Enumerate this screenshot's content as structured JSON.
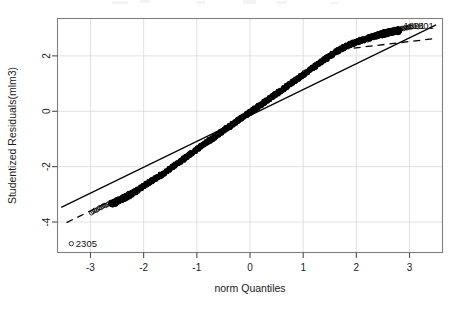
{
  "chart_data": {
    "type": "scatter",
    "title": "",
    "xlabel": "norm Quantiles",
    "ylabel": "Studentized Residuals(mlm3)",
    "xlim": [
      -3.62,
      3.62
    ],
    "ylim": [
      -5.1,
      3.35
    ],
    "xticks": [
      -3,
      -2,
      -1,
      0,
      1,
      2,
      3
    ],
    "xtick_labels": [
      "-3",
      "-2",
      "-1",
      "0",
      "1",
      "2",
      "3"
    ],
    "yticks": [
      -4,
      -2,
      0,
      2
    ],
    "ytick_labels": [
      "-4",
      "-2",
      "0",
      "2"
    ],
    "grid": true,
    "legend": "none",
    "annotations": [
      {
        "label": "2305",
        "x": -3.36,
        "y": -4.78,
        "marker": "open-circle",
        "position": "bottom-left"
      },
      {
        "label": "1801",
        "x": 3.02,
        "y": 3.05,
        "marker": "none",
        "position": "top-right"
      },
      {
        "label": "1891",
        "x": 3.16,
        "y": 3.05,
        "marker": "open-circle",
        "position": "top-right"
      }
    ],
    "series": [
      {
        "name": "studentized residuals",
        "marker": "open-circle",
        "color": "#000000",
        "n_points": 2400,
        "description": "dense quantile cloud rising monotonically from lower-left to upper-right, S-shaped deviation below the reference line in the left tail and above it in the right tail",
        "tail_points": [
          {
            "x": -3.36,
            "y": -4.78
          },
          {
            "x": -2.95,
            "y": -3.62
          },
          {
            "x": -2.86,
            "y": -3.53
          },
          {
            "x": -2.78,
            "y": -3.44
          },
          {
            "x": -2.7,
            "y": -3.38
          },
          {
            "x": -2.62,
            "y": -3.32
          },
          {
            "x": -2.54,
            "y": -3.26
          },
          {
            "x": -2.46,
            "y": -3.18
          },
          {
            "x": -2.38,
            "y": -3.1
          },
          {
            "x": -2.3,
            "y": -3.02
          },
          {
            "x": -2.2,
            "y": -2.92
          },
          {
            "x": -2.1,
            "y": -2.8
          },
          {
            "x": -2.0,
            "y": -2.66
          },
          {
            "x": -1.9,
            "y": -2.54
          },
          {
            "x": -1.8,
            "y": -2.42
          },
          {
            "x": -1.7,
            "y": -2.3
          },
          {
            "x": -1.6,
            "y": -2.18
          },
          {
            "x": -1.5,
            "y": -2.04
          },
          {
            "x": -1.4,
            "y": -1.9
          },
          {
            "x": -1.2,
            "y": -1.62
          },
          {
            "x": -1.0,
            "y": -1.34
          },
          {
            "x": -0.8,
            "y": -1.07
          },
          {
            "x": -0.6,
            "y": -0.8
          },
          {
            "x": -0.4,
            "y": -0.53
          },
          {
            "x": -0.2,
            "y": -0.26
          },
          {
            "x": 0.0,
            "y": 0.0
          },
          {
            "x": 0.2,
            "y": 0.27
          },
          {
            "x": 0.4,
            "y": 0.54
          },
          {
            "x": 0.6,
            "y": 0.81
          },
          {
            "x": 0.8,
            "y": 1.08
          },
          {
            "x": 1.0,
            "y": 1.36
          },
          {
            "x": 1.2,
            "y": 1.63
          },
          {
            "x": 1.4,
            "y": 1.9
          },
          {
            "x": 1.6,
            "y": 2.16
          },
          {
            "x": 1.8,
            "y": 2.38
          },
          {
            "x": 2.0,
            "y": 2.54
          },
          {
            "x": 2.2,
            "y": 2.66
          },
          {
            "x": 2.4,
            "y": 2.78
          },
          {
            "x": 2.6,
            "y": 2.88
          },
          {
            "x": 2.8,
            "y": 2.96
          },
          {
            "x": 3.02,
            "y": 3.05
          },
          {
            "x": 3.16,
            "y": 3.05
          }
        ]
      }
    ],
    "reference_line": {
      "name": "qq reference line",
      "style": "solid",
      "color": "#000000",
      "x_start": -3.55,
      "y_start": -3.47,
      "x_end": 3.5,
      "y_end": 3.12
    },
    "confidence_envelope": {
      "name": "pointwise confidence envelope",
      "style": "dashed",
      "color": "#000000",
      "upper_tail_right": {
        "x_start": 1.95,
        "y_start": 2.28,
        "x_end": 3.45,
        "y_end": 2.62
      },
      "lower_tail_left": {
        "x_start": -3.45,
        "y_start": -4.02,
        "x_end": -2.05,
        "y_end": -2.7
      }
    }
  },
  "figure": {
    "background_color": "#ffffff",
    "frame_color": "#808080",
    "grid_color": "#d9d9d9",
    "data_color": "#000000"
  }
}
